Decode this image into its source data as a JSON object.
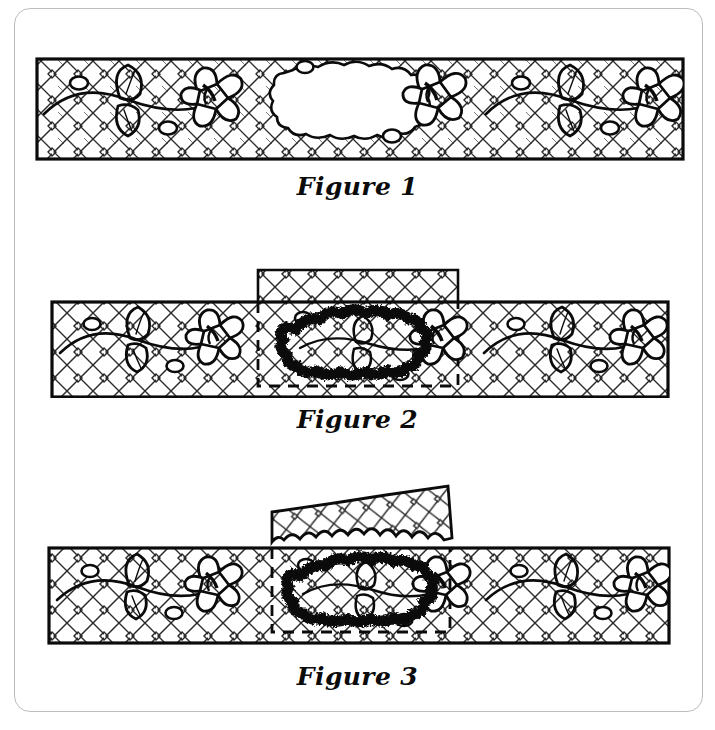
{
  "document": {
    "kind": "sewing-instruction-diagram",
    "title": "Mending a hole with an appliqué patch",
    "page_background": "#ffffff",
    "frame": {
      "present": true,
      "style": "rounded-rectangle-outline",
      "color": "#b9bcc0"
    },
    "ink_color": "#0b0b0b",
    "fill_color": "#ffffff"
  },
  "figures": [
    {
      "id": "figure-1",
      "caption": "Figure 1",
      "subject": "damaged fabric strip with hole",
      "fabric": {
        "pattern": "diagonal crosshatch",
        "border": "solid",
        "motifs": [
          "flower-spray",
          "flower-spray",
          "flower-spray"
        ],
        "flower_count": 3,
        "bud_dot_count": 6
      },
      "hole": {
        "present": true,
        "shape": "irregular-blob",
        "fill": "#ffffff",
        "outline": "wavy-thin",
        "position": "center"
      },
      "patch": {
        "present": false
      },
      "stitching": {
        "present": false
      },
      "trim": {
        "present": false
      }
    },
    {
      "id": "figure-2",
      "caption": "Figure 2",
      "subject": "patch pinned over hole and satin-stitched",
      "fabric": {
        "pattern": "diagonal crosshatch",
        "border": "solid",
        "motifs": [
          "flower-spray",
          "flower-spray",
          "flower-spray"
        ],
        "flower_count": 3,
        "bud_dot_count": 6
      },
      "hole": {
        "present": false
      },
      "patch": {
        "present": true,
        "shape": "rectangle",
        "top_edge": "solid",
        "side_and_bottom_edges": "dashed",
        "overhang": "above-strip",
        "pattern": "diagonal crosshatch"
      },
      "stitching": {
        "present": true,
        "type": "satin-zigzag-outline",
        "weight": "heavy",
        "color": "#0b0b0b",
        "follows": "hole-outline"
      },
      "trim": {
        "present": false
      }
    },
    {
      "id": "figure-3",
      "caption": "Figure 3",
      "subject": "excess patch fabric trimmed away",
      "fabric": {
        "pattern": "diagonal crosshatch",
        "border": "solid",
        "motifs": [
          "flower-spray",
          "flower-spray",
          "flower-spray"
        ],
        "flower_count": 3,
        "bud_dot_count": 6
      },
      "hole": {
        "present": false
      },
      "patch": {
        "present": true,
        "shape": "rectangle",
        "top_edge": "none",
        "side_and_bottom_edges": "dashed",
        "overhang": "lifted-flap",
        "pattern": "diagonal crosshatch"
      },
      "stitching": {
        "present": true,
        "type": "satin-zigzag-outline",
        "weight": "heavy",
        "color": "#0b0b0b",
        "follows": "hole-outline"
      },
      "trim": {
        "present": true,
        "description": "excess fabric peeled up at an angle with jagged cut edge",
        "cut_edge": "jagged"
      }
    }
  ],
  "icons": {
    "flower": "flower-icon",
    "leaf": "leaf-icon",
    "bud": "bud-dot-icon",
    "hatch": "crosshatch-icon",
    "satin_stitch": "satin-stitch-icon",
    "dashed_box": "dashed-box-icon",
    "scissors_cut": "jagged-cut-icon"
  }
}
